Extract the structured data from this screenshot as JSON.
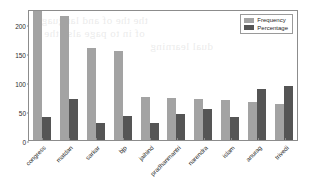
{
  "chart_data": {
    "type": "bar",
    "title": "",
    "xlabel": "",
    "ylabel": "",
    "ylim": [
      0,
      225
    ],
    "yticks": [
      0,
      50,
      100,
      150,
      200
    ],
    "grid": false,
    "legend_position": "upper right",
    "categories": [
      "congress",
      "matdan",
      "sarkar",
      "bjp",
      "jaihind",
      "pradhanmantri",
      "narendra",
      "islam",
      "anurag",
      "trivedi"
    ],
    "series": [
      {
        "name": "Frequency",
        "color": "#a3a3a3",
        "values": [
          221,
          213,
          158,
          153,
          74,
          73,
          71,
          68,
          66,
          62
        ]
      },
      {
        "name": "Percentage",
        "color": "#555555",
        "values": [
          39,
          71,
          30,
          41,
          30,
          44,
          54,
          40,
          88,
          93
        ]
      }
    ]
  },
  "legend": {
    "entries": [
      {
        "label": "Frequency"
      },
      {
        "label": "Percentage"
      }
    ]
  },
  "bleed_through": {
    "lines": [
      "the the of and language",
      "of in to page also the",
      "dual learning"
    ]
  }
}
